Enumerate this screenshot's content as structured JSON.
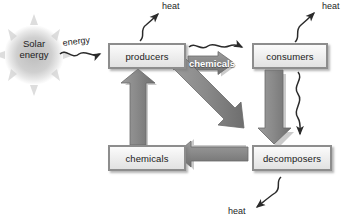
{
  "diagram": {
    "type": "flow-diagram",
    "colors": {
      "arrow_fill": "#8a8a8a",
      "arrow_edge": "#6f6f6f",
      "box_border": "#8d8d8d",
      "box_fill": "#ededed",
      "text": "#1d1d1d",
      "flow_label_text": "#ffffff",
      "sun_fill": "#c9c9c9"
    },
    "sun": {
      "name": "solar-energy-source",
      "line1": "Solar",
      "line2": "energy"
    },
    "nodes": [
      {
        "id": "producers",
        "label": "producers"
      },
      {
        "id": "consumers",
        "label": "consumers"
      },
      {
        "id": "decomposers",
        "label": "decomposers"
      },
      {
        "id": "chemicals",
        "label": "chemicals"
      }
    ],
    "flow_labels": {
      "energy": "energy",
      "chemicals": "chemicals"
    },
    "heat_labels": {
      "top": "heat",
      "right": "heat",
      "bottom": "heat"
    },
    "edges": [
      {
        "from": "solar",
        "to": "producers",
        "label": "energy",
        "style": "wavy-thin"
      },
      {
        "from": "producers",
        "to": "consumers",
        "label": "chemicals",
        "style": "thick-block"
      },
      {
        "from": "producers",
        "to": "consumers",
        "label": "",
        "style": "wavy-thin"
      },
      {
        "from": "producers",
        "to": "decomposers",
        "label": "",
        "style": "thick-block"
      },
      {
        "from": "consumers",
        "to": "decomposers",
        "label": "",
        "style": "thick-block"
      },
      {
        "from": "consumers",
        "to": "decomposers",
        "label": "",
        "style": "wavy-thin"
      },
      {
        "from": "decomposers",
        "to": "chemicals",
        "label": "",
        "style": "thick-block"
      },
      {
        "from": "chemicals",
        "to": "producers",
        "label": "",
        "style": "thick-block"
      },
      {
        "from": "producers",
        "to": "heat",
        "label": "heat",
        "style": "wavy-thin"
      },
      {
        "from": "consumers",
        "to": "heat",
        "label": "heat",
        "style": "wavy-thin"
      },
      {
        "from": "decomposers",
        "to": "heat",
        "label": "heat",
        "style": "wavy-thin"
      }
    ]
  }
}
